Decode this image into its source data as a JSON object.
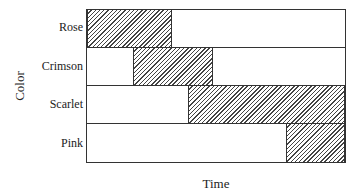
{
  "chart_data": {
    "type": "bar",
    "subtype": "gantt",
    "title": "",
    "xlabel": "Time",
    "ylabel": "Color",
    "categories": [
      "Rose",
      "Crimson",
      "Scarlet",
      "Pink"
    ],
    "xlim": [
      0,
      100
    ],
    "series": [
      {
        "name": "Rose",
        "start": 0,
        "end": 33
      },
      {
        "name": "Crimson",
        "start": 18,
        "end": 49
      },
      {
        "name": "Scarlet",
        "start": 39,
        "end": 100
      },
      {
        "name": "Pink",
        "start": 77,
        "end": 100
      }
    ],
    "grid": false,
    "legend": "none",
    "fill": "diagonal-hatch"
  },
  "labels": {
    "x_axis": "Time",
    "y_axis": "Color",
    "rows": [
      "Rose",
      "Crimson",
      "Scarlet",
      "Pink"
    ]
  }
}
